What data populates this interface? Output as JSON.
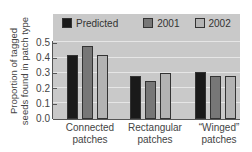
{
  "chart_data": {
    "type": "bar",
    "title": "",
    "xlabel": "",
    "ylabel": "Proportion of tagged seeds found in patch type",
    "ylabel_lines": [
      "Proportion of tagged",
      "seeds found in patch type"
    ],
    "categories": [
      "Connected patches",
      "Rectangular patches",
      "“Winged” patches"
    ],
    "category_lines": [
      [
        "Connected",
        "patches"
      ],
      [
        "Rectangular",
        "patches"
      ],
      [
        "“Winged”",
        "patches"
      ]
    ],
    "series": [
      {
        "name": "Predicted",
        "color": "#1a1a1a",
        "values": [
          0.42,
          0.28,
          0.31
        ]
      },
      {
        "name": "2001",
        "color": "#777777",
        "values": [
          0.48,
          0.25,
          0.28
        ]
      },
      {
        "name": "2002",
        "color": "#b3b3b3",
        "values": [
          0.42,
          0.3,
          0.28
        ]
      }
    ],
    "yticks": [
      "0.0",
      "0.1",
      "0.2",
      "0.3",
      "0.4",
      "0.5"
    ],
    "ylim": [
      0,
      0.5
    ],
    "grid": true,
    "legend_position": "top-inside",
    "background": "#c9c9c9"
  }
}
